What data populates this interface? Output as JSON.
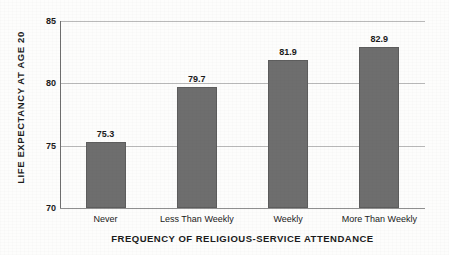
{
  "chart_data": {
    "type": "bar",
    "title": "",
    "xlabel": "FREQUENCY OF RELIGIOUS-SERVICE ATTENDANCE",
    "ylabel": "LIFE EXPECTANCY AT AGE 20",
    "categories": [
      "Never",
      "Less Than Weekly",
      "Weekly",
      "More Than Weekly"
    ],
    "values": [
      75.3,
      79.7,
      81.9,
      82.9
    ],
    "value_labels": [
      "75.3",
      "79.7",
      "81.9",
      "82.9"
    ],
    "ylim": [
      70,
      85
    ],
    "yticks": [
      70,
      75,
      80,
      85
    ],
    "ytick_labels": [
      "70",
      "75",
      "80",
      "85"
    ],
    "grid": true,
    "legend": "none",
    "bar_color": "#6e6e6e",
    "background_color": "#fdfdfc",
    "text_color": "#1b1b1b",
    "gridline_color": "#b9b9b9"
  }
}
